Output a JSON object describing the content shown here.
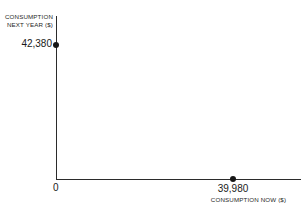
{
  "chart_data": {
    "type": "scatter",
    "title": "",
    "xlabel": "CONSUMPTION NOW ($)",
    "ylabel_line1": "CONSUMPTION",
    "ylabel_line2": "NEXT YEAR ($)",
    "origin_label": "0",
    "x_tick_labels": [
      "0",
      "39,980"
    ],
    "y_tick_labels": [
      "42,380"
    ],
    "points": [
      {
        "name": "y-intercept",
        "x": 0,
        "y": 42380,
        "label": "42,380",
        "on_axis": "y"
      },
      {
        "name": "x-intercept",
        "x": 39980,
        "y": 0,
        "label": "39,980",
        "on_axis": "x"
      }
    ],
    "xlim": [
      0,
      49000
    ],
    "ylim": [
      0,
      52000
    ],
    "grid": false,
    "legend": null,
    "axis_color": "#2b2b2b",
    "point_color": "#161616",
    "background_color": "#ffffff"
  }
}
